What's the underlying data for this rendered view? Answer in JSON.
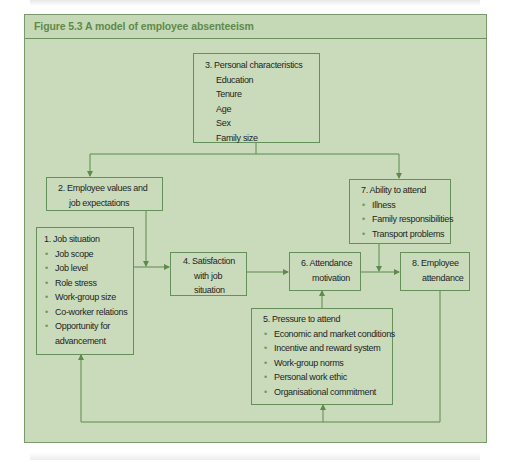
{
  "figure": {
    "title": "Figure 5.3  A model of employee absenteeism",
    "colors": {
      "background": "#c9dbbb",
      "line": "#5e8a4c",
      "title_text": "#5f8a4c",
      "text": "#1e1e1e"
    }
  },
  "boxes": {
    "b3": {
      "title": "3.  Personal characteristics",
      "items": [
        "Education",
        "Tenure",
        "Age",
        "Sex",
        "Family size"
      ],
      "bulleted": false
    },
    "b2": {
      "title_line1": "2.  Employee values and",
      "title_line2": "job expectations"
    },
    "b1": {
      "title": "1. Job situation",
      "items": [
        "Job scope",
        "Job level",
        "Role stress",
        "Work-group size",
        "Co-worker relations",
        "Opportunity for",
        "advancement"
      ],
      "bullets": [
        "•",
        "•",
        "•",
        "•",
        "•",
        "•",
        ""
      ]
    },
    "b4": {
      "line1": "4.  Satisfaction",
      "line2": "with job",
      "line3": "situation"
    },
    "b7": {
      "title": "7.  Ability to attend",
      "items": [
        "Illness",
        "Family responsibilities",
        "Transport problems"
      ],
      "bullet": "•"
    },
    "b6": {
      "line1": "6.  Attendance",
      "line2": "motivation"
    },
    "b8": {
      "line1": "8.   Employee",
      "line2": "attendance"
    },
    "b5": {
      "title": "5.  Pressure to attend",
      "items": [
        "Economic and market conditions",
        "Incentive and reward system",
        "Work-group norms",
        "Personal work ethic",
        "Organisational commitment"
      ],
      "bullet": "•"
    }
  }
}
